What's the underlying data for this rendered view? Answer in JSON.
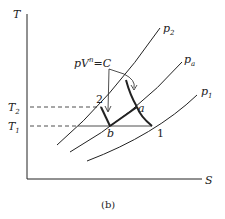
{
  "diagram": {
    "type": "T-S diagram (two-stage compression with intercooling)",
    "axes": {
      "y_label": "T",
      "x_label": "S"
    },
    "isobars": [
      {
        "id": "p2",
        "label": "p",
        "sub": "2"
      },
      {
        "id": "pa",
        "label": "p",
        "sub": "a"
      },
      {
        "id": "p1",
        "label": "p",
        "sub": "1"
      }
    ],
    "temperatures": [
      {
        "id": "T2",
        "label": "T",
        "sub": "2"
      },
      {
        "id": "T1",
        "label": "T",
        "sub": "1"
      }
    ],
    "points": {
      "p2_point": "2",
      "pb_point": "b",
      "pa_point": "a",
      "p1_point": "1"
    },
    "process_label": {
      "main": "pV",
      "sup": "n",
      "rest": "=C"
    },
    "caption": "(b)",
    "colors": {
      "line": "#222222",
      "background": "#ffffff"
    }
  }
}
